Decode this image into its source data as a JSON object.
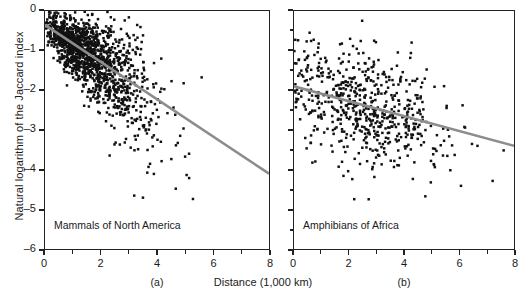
{
  "chart_data": {
    "type": "scatter",
    "title": "",
    "xlabel": "Distance (1,000 km)",
    "ylabel": "Natural logarithm of the Jaccard index",
    "xlim": [
      0,
      8
    ],
    "ylim": [
      -6,
      0
    ],
    "xticks": [
      0,
      2,
      4,
      6,
      8
    ],
    "xticklabels": [
      "0",
      "2",
      "4",
      "6",
      "8"
    ],
    "xminorticks": [
      1,
      3,
      5,
      7
    ],
    "yticks": [
      0,
      -1,
      -2,
      -3,
      -4,
      -5,
      -6
    ],
    "yticklabels": [
      "0",
      "–1",
      "–2",
      "–3",
      "–4",
      "–5",
      "–6"
    ],
    "grid": false,
    "legend": "none",
    "point_color": "#111111",
    "fit_color": "#8c8c8c",
    "panels": [
      {
        "key": "a",
        "sublabel": "(a)",
        "annotation": "Mammals of North America",
        "n_points": 1400,
        "fit": {
          "x0": 0,
          "y0": -0.35,
          "x1": 8,
          "y1": -4.1,
          "slope": -0.469,
          "intercept": -0.35
        },
        "scatter_model": {
          "x_distribution": "right-skewed, mode near 1.2, range 0 to 8",
          "y_mean_at_x": "-0.35 - 0.469*x",
          "y_spread_at_x": "0.22 + 0.17*x",
          "density": "very dense wedge near origin, fanning downward"
        }
      },
      {
        "key": "b",
        "sublabel": "(b)",
        "annotation": "Amphibians of Africa",
        "n_points": 620,
        "fit": {
          "x0": 0,
          "y0": -1.9,
          "x1": 8,
          "y1": -3.4,
          "slope": -0.1875,
          "intercept": -1.9
        },
        "scatter_model": {
          "x_distribution": "broad, mode near 2.6, range 0 to 8",
          "y_mean_at_x": "-1.9 - 0.1875*x",
          "y_spread_at_x": "0.72",
          "density": "diffuse cloud, denser between x=1 and x=4"
        }
      }
    ]
  }
}
